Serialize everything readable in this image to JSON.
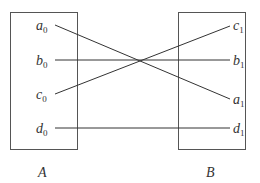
{
  "diagram": {
    "type": "bijection-mapping",
    "colors": {
      "stroke": "#333333",
      "box": "#555555",
      "background": "#ffffff"
    },
    "set_a": {
      "name": "A",
      "elements": [
        {
          "letter": "a",
          "sub": "0"
        },
        {
          "letter": "b",
          "sub": "0"
        },
        {
          "letter": "c",
          "sub": "0"
        },
        {
          "letter": "d",
          "sub": "0"
        }
      ]
    },
    "set_b": {
      "name": "B",
      "elements": [
        {
          "letter": "c",
          "sub": "1"
        },
        {
          "letter": "b",
          "sub": "1"
        },
        {
          "letter": "a",
          "sub": "1"
        },
        {
          "letter": "d",
          "sub": "1"
        }
      ]
    },
    "mappings": [
      {
        "from": "a0",
        "to": "a1"
      },
      {
        "from": "b0",
        "to": "b1"
      },
      {
        "from": "c0",
        "to": "c1"
      },
      {
        "from": "d0",
        "to": "d1"
      }
    ]
  }
}
